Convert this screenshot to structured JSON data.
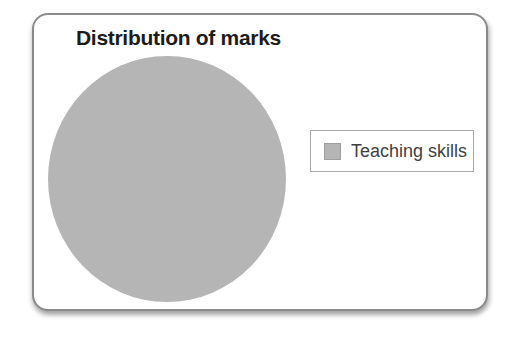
{
  "chart_data": {
    "type": "pie",
    "title": "Distribution of marks",
    "categories": [
      "Teaching skills"
    ],
    "values": [
      100
    ],
    "colors": [
      "#b5b5b5"
    ],
    "legend_position": "right",
    "grid": false
  },
  "legend": {
    "items": [
      {
        "label": "Teaching skills",
        "color": "#b5b5b5"
      }
    ]
  },
  "card": {
    "border_color": "#8a8a8a",
    "background": "#ffffff"
  }
}
